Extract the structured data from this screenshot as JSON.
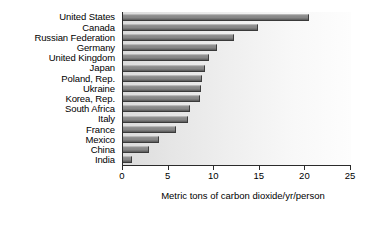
{
  "chart_data": {
    "type": "bar",
    "orientation": "horizontal",
    "title": "",
    "xlabel": "Metric tons of carbon dioxide/yr/person",
    "ylabel": "",
    "xlim": [
      0,
      25
    ],
    "xticks": [
      0,
      5,
      10,
      15,
      20,
      25
    ],
    "grid": false,
    "legend": null,
    "categories": [
      "United States",
      "Canada",
      "Russian Federation",
      "Germany",
      "United Kingdom",
      "Japan",
      "Poland, Rep.",
      "Ukraine",
      "Korea, Rep.",
      "South Africa",
      "Italy",
      "France",
      "Mexico",
      "China",
      "India"
    ],
    "values": [
      20.4,
      14.8,
      12.2,
      10.3,
      9.4,
      9.0,
      8.7,
      8.5,
      8.4,
      7.3,
      7.1,
      5.8,
      3.9,
      2.9,
      1.0
    ],
    "colors": {
      "bar_fill": "#868686",
      "bar_edge": "#3a3a3a",
      "axis": "#2b2b2b",
      "plot_background_left": "#dcdcdc",
      "plot_background_right": "#fdfdfd",
      "page_background": "#ffffff",
      "text": "#000000"
    }
  }
}
